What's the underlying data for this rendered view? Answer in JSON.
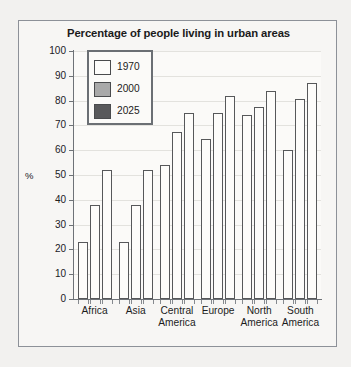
{
  "chart_data": {
    "type": "bar",
    "title": "Percentage of people living in urban areas",
    "xlabel": "",
    "ylabel": "%",
    "ylim": [
      0,
      100
    ],
    "ytick_step": 10,
    "yticks": [
      0,
      10,
      20,
      30,
      40,
      50,
      60,
      70,
      80,
      90,
      100
    ],
    "ytick_labels": [
      "0",
      "10",
      "20",
      "30",
      "40",
      "50",
      "60",
      "70",
      "80",
      "90",
      "100"
    ],
    "grid": true,
    "legend_position": "upper-left-inside",
    "categories": [
      "Africa",
      "Asia",
      "Central America",
      "Europe",
      "North America",
      "South America"
    ],
    "category_lines": [
      [
        "Africa",
        ""
      ],
      [
        "Asia",
        ""
      ],
      [
        "Central",
        "America"
      ],
      [
        "Europe",
        ""
      ],
      [
        "North",
        "America"
      ],
      [
        "South",
        "America"
      ]
    ],
    "series": [
      {
        "name": "1970",
        "color": "#fdfcfa",
        "values": [
          23,
          23,
          54,
          64.5,
          74,
          60
        ]
      },
      {
        "name": "2000",
        "color": "#a9a9a9",
        "values": [
          38,
          38,
          67.5,
          75,
          77.5,
          80.5
        ]
      },
      {
        "name": "2025",
        "color": "#59595b",
        "values": [
          52,
          52,
          75,
          82,
          84,
          87
        ]
      }
    ],
    "bar_outline_color": "#57585a",
    "bar_fill_color": "#fdfcfa"
  },
  "legend": {
    "entries": [
      {
        "label": "1970",
        "swatch": "#fdfcfa"
      },
      {
        "label": "2000",
        "swatch": "#a9a9a9"
      },
      {
        "label": "2025",
        "swatch": "#59595b"
      }
    ]
  }
}
